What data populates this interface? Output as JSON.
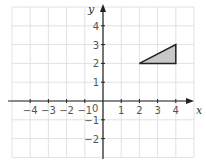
{
  "chart_data": {
    "type": "scatter",
    "title": "",
    "xlabel": "x",
    "ylabel": "y",
    "xlim": [
      -5,
      5
    ],
    "ylim": [
      -3,
      5
    ],
    "grid": true,
    "x_ticks": [
      -4,
      -3,
      -2,
      -1,
      1,
      2,
      3,
      4
    ],
    "y_ticks": [
      -2,
      -1,
      1,
      2,
      3,
      4
    ],
    "origin_label": "0",
    "shapes": [
      {
        "name": "triangle",
        "vertices": [
          [
            2,
            2
          ],
          [
            4,
            2
          ],
          [
            4,
            3
          ]
        ],
        "fill": "#c8c8c8",
        "stroke": "#222222"
      }
    ]
  },
  "labels": {
    "x_axis": "x",
    "y_axis": "y",
    "origin": "0",
    "x_ticks": [
      "−4",
      "−3",
      "−2",
      "−1",
      "1",
      "2",
      "3",
      "4"
    ],
    "y_ticks": [
      "4",
      "3",
      "2",
      "1",
      "−1",
      "−2"
    ]
  },
  "colors": {
    "grid": "#e2e2e2",
    "axis": "#222222",
    "triangle_fill": "#c8c8c8",
    "triangle_stroke": "#222222"
  }
}
